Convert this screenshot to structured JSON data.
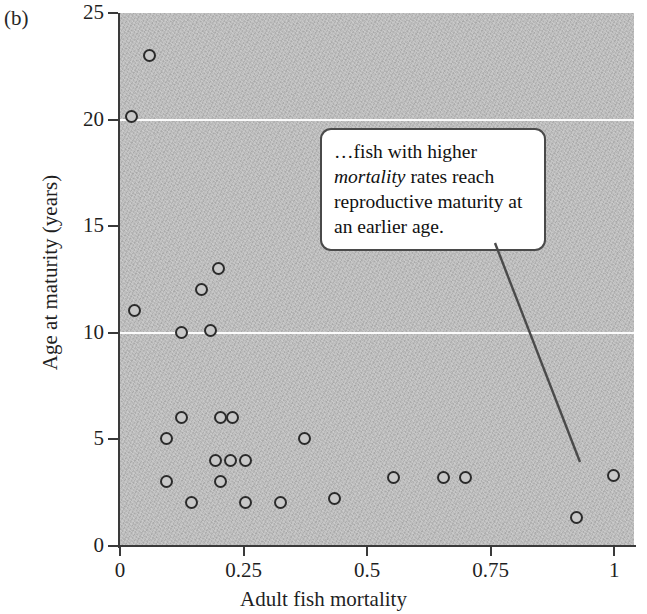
{
  "panel": {
    "label": "(b)"
  },
  "callout": {
    "text_before": "…fish with higher ",
    "emphasis": "mortality",
    "text_after": " rates reach reproductive maturity at an earlier age.",
    "full_text": "…fish with higher mortality rates reach reproductive maturity at an earlier age."
  },
  "chart_data": {
    "type": "scatter",
    "title": "",
    "xlabel": "Adult fish mortality",
    "ylabel": "Age at maturity (years)",
    "xlim": [
      0,
      1.04
    ],
    "ylim": [
      0,
      25
    ],
    "xticks": [
      0,
      0.25,
      0.5,
      0.75,
      1
    ],
    "xtick_labels": [
      "0",
      "0.25",
      "0.5",
      "0.75",
      "1"
    ],
    "yticks": [
      0,
      5,
      10,
      15,
      20,
      25
    ],
    "ytick_labels": [
      "0",
      "5",
      "10",
      "15",
      "20",
      "25"
    ],
    "grid": true,
    "gridlines_y": [
      10,
      20
    ],
    "grid_color": "#fbfbfb",
    "plot_background": "#bdbdbd",
    "marker": {
      "shape": "open-circle",
      "edge_color": "#2b2b2b",
      "fill_color": "#c8c8c8",
      "size_px": 13
    },
    "legend": null,
    "points": [
      {
        "x": 0.06,
        "y": 23.0
      },
      {
        "x": 0.025,
        "y": 20.1
      },
      {
        "x": 0.03,
        "y": 11.0
      },
      {
        "x": 0.2,
        "y": 13.0
      },
      {
        "x": 0.165,
        "y": 12.0
      },
      {
        "x": 0.125,
        "y": 10.0
      },
      {
        "x": 0.185,
        "y": 10.1
      },
      {
        "x": 0.125,
        "y": 6.0
      },
      {
        "x": 0.205,
        "y": 6.0
      },
      {
        "x": 0.228,
        "y": 6.0
      },
      {
        "x": 0.095,
        "y": 5.0
      },
      {
        "x": 0.375,
        "y": 5.0
      },
      {
        "x": 0.195,
        "y": 4.0
      },
      {
        "x": 0.225,
        "y": 4.0
      },
      {
        "x": 0.255,
        "y": 4.0
      },
      {
        "x": 0.095,
        "y": 3.0
      },
      {
        "x": 0.205,
        "y": 3.0
      },
      {
        "x": 0.555,
        "y": 3.2
      },
      {
        "x": 0.655,
        "y": 3.2
      },
      {
        "x": 0.7,
        "y": 3.2
      },
      {
        "x": 1.0,
        "y": 3.3
      },
      {
        "x": 0.145,
        "y": 2.0
      },
      {
        "x": 0.255,
        "y": 2.0
      },
      {
        "x": 0.325,
        "y": 2.0
      },
      {
        "x": 0.435,
        "y": 2.2
      },
      {
        "x": 0.925,
        "y": 1.3
      }
    ],
    "annotations": [
      {
        "text": "…fish with higher mortality rates reach reproductive maturity at an earlier age.",
        "type": "callout-box",
        "pointer_from": {
          "x_px": 495,
          "y_px": 243
        },
        "pointer_to": {
          "x_px": 580,
          "y_px": 462
        }
      }
    ]
  }
}
